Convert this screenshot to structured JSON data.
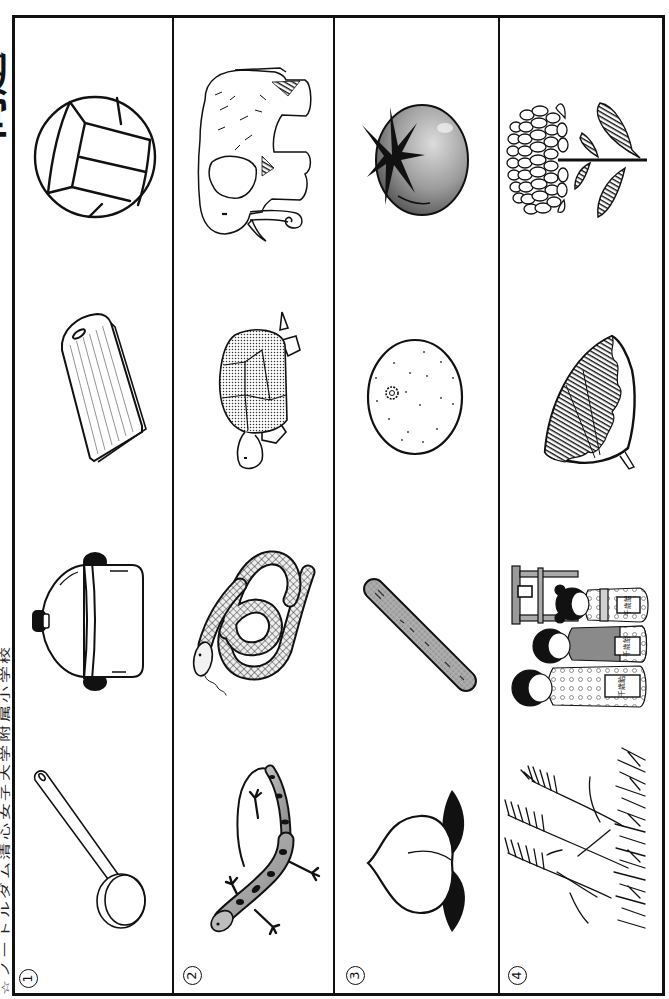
{
  "header": {
    "title": "問題"
  },
  "footer": {
    "credit": "☆ノートルダム清心女子大学附属小学校"
  },
  "colors": {
    "ink": "#111111",
    "paper": "#ffffff",
    "shade": "#9a9a9a"
  },
  "rows": [
    {
      "number": "1",
      "items": [
        {
          "icon": "volleyball"
        },
        {
          "icon": "cutting-board"
        },
        {
          "icon": "pot-with-lid"
        },
        {
          "icon": "ladle"
        }
      ]
    },
    {
      "number": "2",
      "items": [
        {
          "icon": "elephant"
        },
        {
          "icon": "tortoise"
        },
        {
          "icon": "snake"
        },
        {
          "icon": "lizard"
        }
      ]
    },
    {
      "number": "3",
      "items": [
        {
          "icon": "tomato"
        },
        {
          "icon": "mandarin-orange"
        },
        {
          "icon": "cucumber"
        },
        {
          "icon": "peach"
        }
      ]
    },
    {
      "number": "4",
      "items": [
        {
          "icon": "chrysanthemum"
        },
        {
          "icon": "ginkgo-leaf"
        },
        {
          "icon": "shichi-go-san-children"
        },
        {
          "icon": "susuki-pampas-grass"
        }
      ],
      "bag_label": "千歳飴"
    }
  ]
}
